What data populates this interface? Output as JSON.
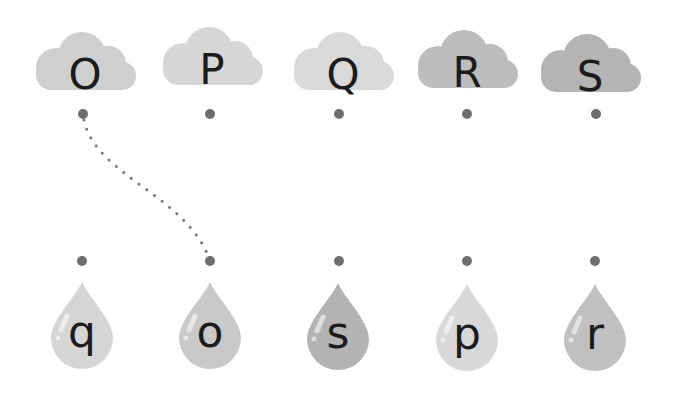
{
  "clouds": [
    {
      "label": "O",
      "color": "#cfcfcf",
      "x": 30,
      "y": 30
    },
    {
      "label": "P",
      "color": "#d6d6d6",
      "x": 157,
      "y": 25
    },
    {
      "label": "Q",
      "color": "#d9d9d9",
      "x": 288,
      "y": 30
    },
    {
      "label": "R",
      "color": "#bdbdbd",
      "x": 412,
      "y": 28
    },
    {
      "label": "S",
      "color": "#b4b4b4",
      "x": 535,
      "y": 32
    }
  ],
  "drops": [
    {
      "label": "q",
      "color": "#d5d5d5",
      "x": 49,
      "y": 280
    },
    {
      "label": "o",
      "color": "#c9c9c9",
      "x": 177,
      "y": 280
    },
    {
      "label": "s",
      "color": "#b3b3b3",
      "x": 305,
      "y": 281
    },
    {
      "label": "p",
      "color": "#d8d8d8",
      "x": 434,
      "y": 282
    },
    {
      "label": "r",
      "color": "#c0c0c0",
      "x": 562,
      "y": 282
    }
  ],
  "top_dots_x": [
    83,
    210,
    339,
    467,
    596
  ],
  "bottom_dots_x": [
    82,
    210,
    339,
    467,
    595
  ],
  "connections": [
    {
      "from": "O",
      "to": "o"
    }
  ]
}
